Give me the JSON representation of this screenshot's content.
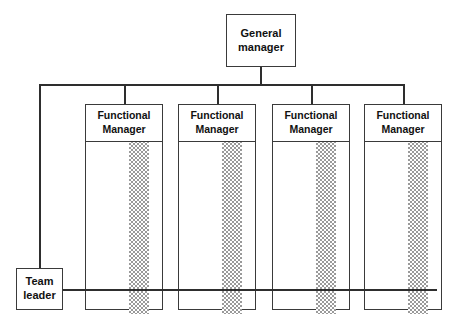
{
  "diagram": {
    "type": "organizational-chart",
    "style": {
      "line_color": "#2e2e2e",
      "box_border_color": "#3a3a3a",
      "box_fill": "#ffffff",
      "hatch_color": "#9a9a9a",
      "text_color": "#111111",
      "background": "#ffffff"
    }
  },
  "general_manager": {
    "line1": "General",
    "line2": "manager"
  },
  "team_leader": {
    "line1": "Team",
    "line2": "leader"
  },
  "functional_managers": [
    {
      "line1": "Functional",
      "line2": "Manager"
    },
    {
      "line1": "Functional",
      "line2": "Manager"
    },
    {
      "line1": "Functional",
      "line2": "Manager"
    },
    {
      "line1": "Functional",
      "line2": "Manager"
    }
  ]
}
